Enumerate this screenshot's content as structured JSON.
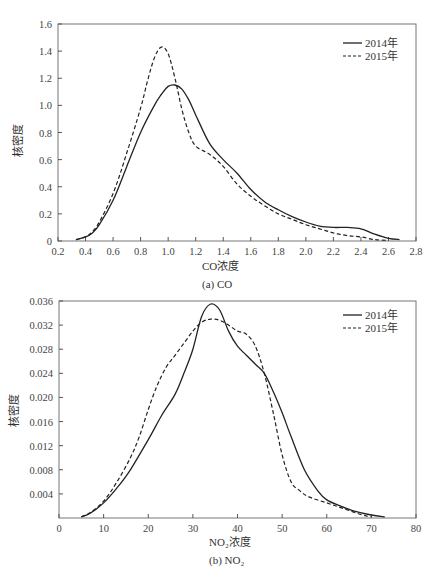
{
  "chart_data": [
    {
      "type": "line",
      "title": "",
      "caption": "(a) CO",
      "xlabel": "CO浓度",
      "ylabel": "核密度",
      "xlim": [
        0.2,
        2.8
      ],
      "ylim": [
        0,
        1.6
      ],
      "xticks": [
        "0.2",
        "0.4",
        "0.6",
        "0.8",
        "1.0",
        "1.2",
        "1.4",
        "1.6",
        "1.8",
        "2.0",
        "2.2",
        "2.4",
        "2.6",
        "2.8"
      ],
      "yticks": [
        "0",
        "0.2",
        "0.4",
        "0.6",
        "0.8",
        "1.0",
        "1.2",
        "1.4",
        "1.6"
      ],
      "grid": false,
      "legend_position": "upper right",
      "series": [
        {
          "name": "2014年",
          "style": "solid",
          "x": [
            0.33,
            0.4,
            0.45,
            0.5,
            0.6,
            0.7,
            0.8,
            0.9,
            0.95,
            1.0,
            1.05,
            1.1,
            1.15,
            1.2,
            1.3,
            1.4,
            1.5,
            1.6,
            1.7,
            1.8,
            1.9,
            2.0,
            2.1,
            2.2,
            2.3,
            2.4,
            2.5,
            2.6,
            2.68
          ],
          "y": [
            0.01,
            0.03,
            0.06,
            0.12,
            0.3,
            0.55,
            0.8,
            1.0,
            1.08,
            1.14,
            1.15,
            1.12,
            1.04,
            0.93,
            0.72,
            0.6,
            0.5,
            0.38,
            0.29,
            0.23,
            0.18,
            0.14,
            0.11,
            0.1,
            0.1,
            0.09,
            0.05,
            0.02,
            0.01
          ]
        },
        {
          "name": "2015年",
          "style": "dashed",
          "x": [
            0.33,
            0.4,
            0.45,
            0.5,
            0.6,
            0.7,
            0.8,
            0.85,
            0.9,
            0.95,
            1.0,
            1.05,
            1.1,
            1.15,
            1.2,
            1.3,
            1.4,
            1.5,
            1.6,
            1.7,
            1.8,
            1.9,
            2.0,
            2.1,
            2.2,
            2.3,
            2.4,
            2.5,
            2.6
          ],
          "y": [
            0.01,
            0.03,
            0.07,
            0.14,
            0.35,
            0.65,
            0.98,
            1.18,
            1.35,
            1.43,
            1.38,
            1.2,
            0.97,
            0.8,
            0.7,
            0.64,
            0.55,
            0.42,
            0.33,
            0.26,
            0.2,
            0.16,
            0.12,
            0.09,
            0.06,
            0.04,
            0.03,
            0.01,
            0.005
          ]
        }
      ]
    },
    {
      "type": "line",
      "title": "",
      "caption": "(b) NO₂",
      "xlabel": "NO₂浓度",
      "ylabel": "核密度",
      "xlim": [
        0,
        80
      ],
      "ylim": [
        0,
        0.036
      ],
      "xticks": [
        "0",
        "10",
        "20",
        "30",
        "40",
        "50",
        "60",
        "70",
        "80"
      ],
      "yticks": [
        "0.004",
        "0.008",
        "0.012",
        "0.016",
        "0.020",
        "0.024",
        "0.028",
        "0.032",
        "0.036"
      ],
      "grid": false,
      "legend_position": "upper right",
      "series": [
        {
          "name": "2014年",
          "style": "solid",
          "x": [
            5,
            7,
            10,
            13,
            16,
            20,
            23,
            26,
            28,
            30,
            32,
            34,
            36,
            38,
            40,
            42,
            44,
            46,
            48,
            50,
            52,
            55,
            58,
            60,
            63,
            66,
            70,
            73
          ],
          "y": [
            0.0002,
            0.0008,
            0.0025,
            0.005,
            0.008,
            0.013,
            0.017,
            0.0205,
            0.024,
            0.028,
            0.0335,
            0.0355,
            0.0345,
            0.031,
            0.0285,
            0.027,
            0.0255,
            0.024,
            0.021,
            0.0175,
            0.0135,
            0.008,
            0.0045,
            0.003,
            0.002,
            0.0012,
            0.0005,
            0.0002
          ]
        },
        {
          "name": "2015年",
          "style": "dashed",
          "x": [
            5,
            7,
            10,
            13,
            16,
            18,
            20,
            22,
            24,
            26,
            28,
            30,
            32,
            34,
            36,
            38,
            40,
            42,
            44,
            46,
            48,
            50,
            52,
            54,
            56,
            60,
            64,
            68,
            70
          ],
          "y": [
            0.0002,
            0.0009,
            0.0028,
            0.006,
            0.01,
            0.0135,
            0.018,
            0.022,
            0.025,
            0.027,
            0.029,
            0.031,
            0.0325,
            0.033,
            0.0328,
            0.032,
            0.031,
            0.0305,
            0.0285,
            0.024,
            0.0175,
            0.0105,
            0.006,
            0.0045,
            0.0035,
            0.0025,
            0.0015,
            0.0005,
            0.0002
          ]
        }
      ]
    }
  ],
  "legend": {
    "s2014": "2014年",
    "s2015": "2015年"
  }
}
